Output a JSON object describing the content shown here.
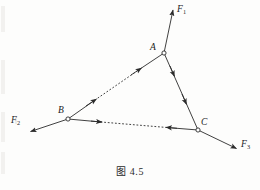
{
  "figure": {
    "caption": "图 4.5",
    "background_color": "#fdfdfc",
    "ink_color": "#2b2b2b"
  },
  "nodes": [
    {
      "id": "A",
      "label": "A",
      "x": 164,
      "y": 53,
      "label_x": 150,
      "label_y": 43
    },
    {
      "id": "B",
      "label": "B",
      "x": 68,
      "y": 119,
      "label_x": 58,
      "label_y": 106
    },
    {
      "id": "C",
      "label": "C",
      "x": 198,
      "y": 130,
      "label_x": 201,
      "label_y": 118
    }
  ],
  "external_forces": [
    {
      "id": "F1",
      "label": "F",
      "subscript": "1",
      "from_node": "A",
      "from_x": 164,
      "from_y": 53,
      "tip_x": 173,
      "tip_y": 9,
      "label_x": 177,
      "label_y": 5,
      "direction": "up-right"
    },
    {
      "id": "F2",
      "label": "F",
      "subscript": "2",
      "from_node": "B",
      "from_x": 68,
      "from_y": 119,
      "tip_x": 29,
      "tip_y": 132,
      "label_x": 11,
      "label_y": 116,
      "direction": "down-left"
    },
    {
      "id": "F3",
      "label": "F",
      "subscript": "3",
      "from_node": "C",
      "from_x": 198,
      "from_y": 130,
      "tip_x": 238,
      "tip_y": 149,
      "label_x": 241,
      "label_y": 140,
      "direction": "down-right"
    }
  ],
  "members": [
    {
      "id": "BA",
      "from_node": "B",
      "to_node": "A",
      "x1": 68,
      "y1": 119,
      "x2": 164,
      "y2": 53,
      "style": "dashed-middle-solid-ends",
      "arrow_direction": "toward-A",
      "arrow_count": 2
    },
    {
      "id": "AC",
      "from_node": "A",
      "to_node": "C",
      "x1": 164,
      "y1": 53,
      "x2": 198,
      "y2": 130,
      "style": "solid",
      "arrow_direction": "toward-C",
      "arrow_count": 2
    },
    {
      "id": "BC",
      "from_node": "B",
      "to_node": "C",
      "x1": 68,
      "y1": 119,
      "x2": 198,
      "y2": 130,
      "style": "dashed-middle-solid-ends",
      "arrow_direction": "inward-both-ends",
      "arrow_count": 2
    }
  ]
}
